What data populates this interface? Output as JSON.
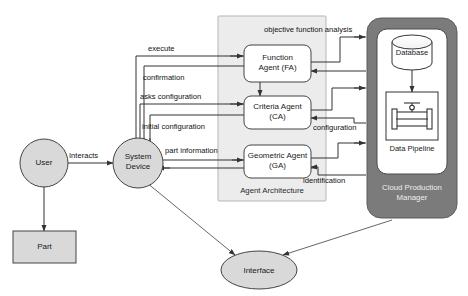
{
  "diagram": {
    "type": "block-flow-diagram",
    "colors": {
      "node_fill": "#d9d9d9",
      "white_fill": "#ffffff",
      "agent_container_fill": "#ececec",
      "cloud_container_fill": "#7b7b7b",
      "stroke": "#333333",
      "text": "#111111",
      "cloud_text": "#efefef"
    }
  },
  "containers": [
    {
      "id": "agent-architecture",
      "label": "Agent Architecture",
      "fill": "#ececec"
    },
    {
      "id": "cloud-production-manager",
      "label": "Cloud Production\nManager",
      "fill": "#7b7b7b"
    }
  ],
  "nodes": {
    "user": {
      "label": "User",
      "shape": "circle"
    },
    "part": {
      "label": "Part",
      "shape": "rectangle"
    },
    "system_device": {
      "label": "System\nDevice",
      "shape": "circle"
    },
    "function_agent": {
      "label": "Function\nAgent (FA)",
      "shape": "rounded-rect"
    },
    "criteria_agent": {
      "label": "Criteria Agent\n(CA)",
      "shape": "rounded-rect"
    },
    "geometric_agent": {
      "label": "Geometric Agent\n(GA)",
      "shape": "rounded-rect"
    },
    "interface": {
      "label": "Interface",
      "shape": "ellipse"
    },
    "database": {
      "label": "Database",
      "shape": "cylinder"
    },
    "data_pipeline": {
      "label": "Data Pipeline",
      "shape": "icon-box",
      "icon": "pipeline-valve-icon"
    }
  },
  "edges": [
    {
      "id": "execute",
      "label": "execute",
      "from": "system_device",
      "to": "function_agent"
    },
    {
      "id": "confirmation",
      "label": "confirmation",
      "from": "function_agent",
      "to": "system_device"
    },
    {
      "id": "asks-configuration",
      "label": "asks configuration",
      "from": "system_device",
      "to": "criteria_agent"
    },
    {
      "id": "initial-configuration",
      "label": "initial configuration",
      "from": "criteria_agent",
      "to": "system_device"
    },
    {
      "id": "part-information",
      "label": "part information",
      "from": "system_device",
      "to": "geometric_agent"
    },
    {
      "id": "objective-function-analysis",
      "label": "objective function analysis",
      "from": "function_agent",
      "to": "cloud-production-manager"
    },
    {
      "id": "configuration",
      "label": "configuration",
      "from": "cloud-production-manager",
      "to": "criteria_agent"
    },
    {
      "id": "identification",
      "label": "identification",
      "from": "cloud-production-manager",
      "to": "geometric_agent"
    },
    {
      "id": "interacts",
      "label": "Interacts",
      "from": "user",
      "to": "system_device"
    },
    {
      "id": "user-part",
      "label": "",
      "from": "user",
      "to": "part"
    },
    {
      "id": "fa-ca",
      "label": "",
      "from": "function_agent",
      "to": "criteria_agent"
    },
    {
      "id": "db-pipeline",
      "label": "",
      "from": "database",
      "to": "data_pipeline"
    },
    {
      "id": "sysdev-interface",
      "label": "",
      "from": "system_device",
      "to": "interface"
    },
    {
      "id": "cloud-interface",
      "label": "",
      "from": "cloud-production-manager",
      "to": "interface"
    }
  ]
}
